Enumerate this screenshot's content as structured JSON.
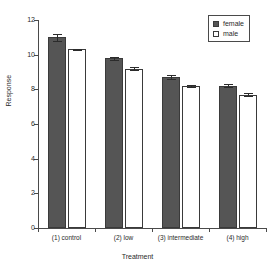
{
  "chart_data": {
    "type": "bar",
    "title": "",
    "xlabel": "Treatment",
    "ylabel": "Response",
    "categories": [
      "(1) control",
      "(2) low",
      "(3) intermediate",
      "(4) high"
    ],
    "series": [
      {
        "name": "female",
        "color": "#555555",
        "values": [
          11.0,
          9.8,
          8.7,
          8.2
        ],
        "errors": [
          0.22,
          0.08,
          0.1,
          0.08
        ]
      },
      {
        "name": "male",
        "color": "#ffffff",
        "values": [
          10.3,
          9.2,
          8.2,
          7.7
        ],
        "errors": [
          0.05,
          0.06,
          0.05,
          0.07
        ]
      }
    ],
    "ylim": [
      0,
      12
    ],
    "yticks": [
      0,
      2,
      4,
      6,
      8,
      10,
      12
    ],
    "ytick_labels": [
      "0",
      "2",
      "4",
      "6",
      "8",
      "10",
      "12"
    ],
    "grid": false,
    "legend_position": "top-right",
    "legend_entries": [
      "female",
      "male"
    ]
  },
  "axes": {
    "y_title": "Response",
    "x_title": "Treatment"
  },
  "legend": {
    "items": [
      {
        "label": "female"
      },
      {
        "label": "male"
      }
    ]
  }
}
